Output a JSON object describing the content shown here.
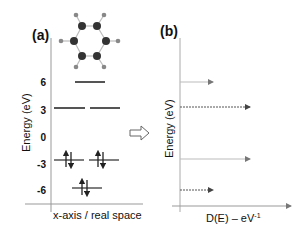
{
  "panel_a": {
    "label": "(a)",
    "ylabel": "Energy (eV)",
    "xlabel": "x-axis / real space",
    "yticks": [
      "6",
      "3",
      "0",
      "-3",
      "-6"
    ],
    "molecule": "benzene",
    "levels": [
      {
        "energy": 6,
        "x1": 75,
        "x2": 105,
        "electrons": 0
      },
      {
        "energy": 3,
        "x1": 54,
        "x2": 85,
        "electrons": 0
      },
      {
        "energy": 3,
        "x1": 90,
        "x2": 120,
        "electrons": 0
      },
      {
        "energy": -3,
        "x1": 54,
        "x2": 84,
        "electrons": 2
      },
      {
        "energy": -3,
        "x1": 89,
        "x2": 119,
        "electrons": 2
      },
      {
        "energy": -6,
        "x1": 72,
        "x2": 102,
        "electrons": 2
      }
    ]
  },
  "transition_arrow": "hollow-right-arrow",
  "panel_b": {
    "label": "(b)",
    "ylabel": "Energy (eV)",
    "xlabel": "D(E) – eV",
    "xlabel_sup": "-1",
    "dos_peaks": [
      {
        "energy": 6,
        "length": 33,
        "style": "light"
      },
      {
        "energy": 3,
        "length": 70,
        "style": "dotted"
      },
      {
        "energy": -3,
        "length": 70,
        "style": "light"
      },
      {
        "energy": -6,
        "length": 33,
        "style": "dotted"
      }
    ]
  },
  "colors": {
    "level": "#555555",
    "axis": "#888888",
    "text": "#111111",
    "atom_c": "#333333",
    "atom_h": "#888888"
  }
}
